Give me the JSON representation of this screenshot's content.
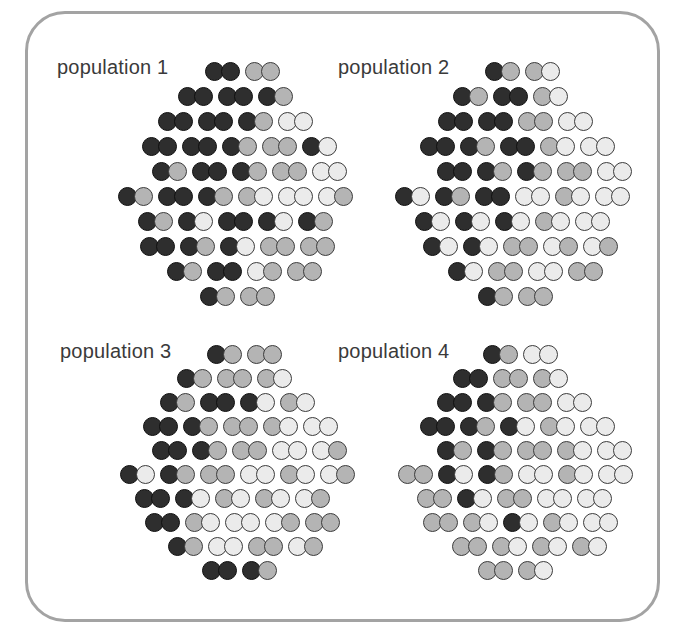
{
  "figure": {
    "panel": {
      "border_color": "#a3a3a3",
      "background": "#ffffff"
    }
  },
  "allele_colors": {
    "D": {
      "name": "dark",
      "fill": "#2e2e2e",
      "stroke": "#101010"
    },
    "G": {
      "name": "gray",
      "fill": "#b4b4b4",
      "stroke": "#3c3c3c"
    },
    "L": {
      "name": "light",
      "fill": "#ebebeb",
      "stroke": "#3c3c3c"
    }
  },
  "geometry": {
    "pair_gap": 5,
    "circle_size": 19
  },
  "populations": [
    {
      "label": "population 1",
      "label_pos": {
        "x": 57,
        "y": 56
      },
      "base_y": 62,
      "row_spacing": 25,
      "rows": [
        {
          "x": 205,
          "pairs": [
            "DD",
            "GG"
          ]
        },
        {
          "x": 178,
          "pairs": [
            "DD",
            "DD",
            "DG"
          ]
        },
        {
          "x": 158,
          "pairs": [
            "DD",
            "DD",
            "DG",
            "LL"
          ]
        },
        {
          "x": 142,
          "pairs": [
            "DD",
            "DD",
            "DG",
            "GG",
            "DL"
          ]
        },
        {
          "x": 152,
          "pairs": [
            "DG",
            "DD",
            "DG",
            "GG",
            "LL"
          ]
        },
        {
          "x": 118,
          "pairs": [
            "DG",
            "DD",
            "DG",
            "GL",
            "LL",
            "LG"
          ]
        },
        {
          "x": 138,
          "pairs": [
            "DG",
            "DL",
            "DD",
            "DL",
            "DG"
          ]
        },
        {
          "x": 140,
          "pairs": [
            "DD",
            "DG",
            "DL",
            "GG",
            "GG"
          ]
        },
        {
          "x": 167,
          "pairs": [
            "DG",
            "DD",
            "LG",
            "GG"
          ]
        },
        {
          "x": 200,
          "pairs": [
            "DG",
            "GG"
          ]
        }
      ]
    },
    {
      "label": "population 2",
      "label_pos": {
        "x": 338,
        "y": 56
      },
      "base_y": 62,
      "row_spacing": 25,
      "rows": [
        {
          "x": 485,
          "pairs": [
            "DG",
            "GL"
          ]
        },
        {
          "x": 453,
          "pairs": [
            "DG",
            "DD",
            "GL"
          ]
        },
        {
          "x": 438,
          "pairs": [
            "DD",
            "DD",
            "GG",
            "LL"
          ]
        },
        {
          "x": 420,
          "pairs": [
            "DD",
            "DG",
            "DD",
            "GL",
            "LL"
          ]
        },
        {
          "x": 437,
          "pairs": [
            "DD",
            "DG",
            "DG",
            "GG",
            "LL"
          ]
        },
        {
          "x": 395,
          "pairs": [
            "DL",
            "DG",
            "DD",
            "LL",
            "GL",
            "LL"
          ]
        },
        {
          "x": 415,
          "pairs": [
            "DL",
            "DL",
            "DL",
            "GL",
            "LL"
          ]
        },
        {
          "x": 423,
          "pairs": [
            "DL",
            "DL",
            "GG",
            "LG",
            "LG"
          ]
        },
        {
          "x": 448,
          "pairs": [
            "DL",
            "GG",
            "LL",
            "GG"
          ]
        },
        {
          "x": 478,
          "pairs": [
            "DG",
            "GG"
          ]
        }
      ]
    },
    {
      "label": "population 3",
      "label_pos": {
        "x": 60,
        "y": 340
      },
      "base_y": 345,
      "row_spacing": 24,
      "rows": [
        {
          "x": 207,
          "pairs": [
            "DG",
            "GG"
          ]
        },
        {
          "x": 177,
          "pairs": [
            "DG",
            "GG",
            "GL"
          ]
        },
        {
          "x": 160,
          "pairs": [
            "DG",
            "DD",
            "DL",
            "GL"
          ]
        },
        {
          "x": 143,
          "pairs": [
            "DD",
            "DG",
            "GG",
            "GL",
            "LL"
          ]
        },
        {
          "x": 152,
          "pairs": [
            "DD",
            "DG",
            "GG",
            "LL",
            "LG"
          ]
        },
        {
          "x": 120,
          "pairs": [
            "DL",
            "DG",
            "GG",
            "LL",
            "GL",
            "LG"
          ]
        },
        {
          "x": 135,
          "pairs": [
            "DD",
            "DL",
            "GL",
            "GL",
            "LG"
          ]
        },
        {
          "x": 145,
          "pairs": [
            "DD",
            "GL",
            "LL",
            "LG",
            "GG"
          ]
        },
        {
          "x": 168,
          "pairs": [
            "DG",
            "LL",
            "GG",
            "LG"
          ]
        },
        {
          "x": 202,
          "pairs": [
            "DD",
            "DG"
          ]
        }
      ]
    },
    {
      "label": "population 4",
      "label_pos": {
        "x": 338,
        "y": 340
      },
      "base_y": 345,
      "row_spacing": 24,
      "rows": [
        {
          "x": 483,
          "pairs": [
            "DG",
            "LL"
          ]
        },
        {
          "x": 453,
          "pairs": [
            "DD",
            "GG",
            "GL"
          ]
        },
        {
          "x": 437,
          "pairs": [
            "DD",
            "DG",
            "GG",
            "LL"
          ]
        },
        {
          "x": 420,
          "pairs": [
            "DD",
            "DG",
            "DL",
            "GL",
            "LL"
          ]
        },
        {
          "x": 437,
          "pairs": [
            "DG",
            "DG",
            "GG",
            "GL",
            "LL"
          ]
        },
        {
          "x": 398,
          "pairs": [
            "GG",
            "DL",
            "DG",
            "LL",
            "GL",
            "LL"
          ]
        },
        {
          "x": 417,
          "pairs": [
            "GG",
            "DL",
            "GG",
            "LL",
            "LL"
          ]
        },
        {
          "x": 423,
          "pairs": [
            "GG",
            "GL",
            "DL",
            "GL",
            "LL"
          ]
        },
        {
          "x": 452,
          "pairs": [
            "GG",
            "GL",
            "GL",
            "GL"
          ]
        },
        {
          "x": 478,
          "pairs": [
            "GG",
            "GL"
          ]
        }
      ]
    }
  ]
}
